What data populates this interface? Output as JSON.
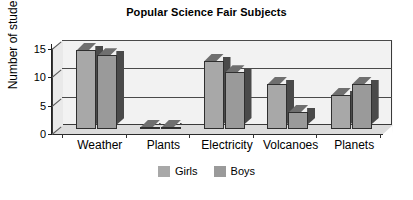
{
  "chart_data": {
    "type": "bar",
    "title": "Popular Science Fair Subjects",
    "xlabel": "",
    "ylabel": "Number of students",
    "categories": [
      "Weather",
      "Plants",
      "Electricity",
      "Volcanoes",
      "Planets"
    ],
    "series": [
      {
        "name": "Girls",
        "values": [
          14,
          0,
          12,
          8,
          6
        ],
        "color": "#a8a8a8"
      },
      {
        "name": "Boys",
        "values": [
          13,
          0,
          10,
          3,
          8
        ],
        "color": "#9a9a9a"
      }
    ],
    "ylim": [
      0,
      15
    ],
    "yticks": [
      0,
      5,
      10,
      15
    ],
    "ytick_labels": [
      "0",
      "5",
      "10",
      "15"
    ],
    "grid": true,
    "legend_position": "bottom",
    "style": "3d-column"
  },
  "legend": {
    "items": [
      {
        "label": "Girls",
        "color": "#a8a8a8"
      },
      {
        "label": "Boys",
        "color": "#9a9a9a"
      }
    ]
  },
  "colors": {
    "plot_background": "#f2f2f2",
    "frame": "#3a3a3a",
    "gridline": "#4a4a4a",
    "floor": "#dcdcdc",
    "text": "#000000"
  }
}
